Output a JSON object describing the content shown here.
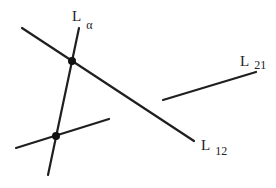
{
  "diagram": {
    "stroke_color": "#1f1f1f",
    "background": "#ffffff",
    "lines": [
      {
        "id": "L12",
        "x1": 22,
        "y1": 28,
        "x2": 194,
        "y2": 141
      },
      {
        "id": "L_alpha",
        "x1": 79,
        "y1": 28,
        "x2": 48,
        "y2": 175
      },
      {
        "id": "short-line",
        "x1": 16,
        "y1": 148,
        "x2": 109,
        "y2": 119
      },
      {
        "id": "L21",
        "x1": 163,
        "y1": 100,
        "x2": 256,
        "y2": 72
      }
    ],
    "points": [
      {
        "id": "upper-intersection",
        "cx": 72,
        "cy": 61,
        "r": 4
      },
      {
        "id": "lower-intersection",
        "cx": 56,
        "cy": 136,
        "r": 4
      }
    ],
    "labels": {
      "alpha": {
        "main": "L",
        "sub": "α"
      },
      "l12": {
        "main": "L",
        "sub": "12"
      },
      "l21": {
        "main": "L",
        "sub": "21"
      }
    }
  }
}
